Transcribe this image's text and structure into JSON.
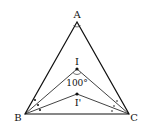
{
  "diagram": {
    "points": {
      "A": {
        "label": "A",
        "x": 77,
        "y": 22
      },
      "B": {
        "label": "B",
        "x": 25,
        "y": 114
      },
      "C": {
        "label": "C",
        "x": 129,
        "y": 114
      },
      "I": {
        "label": "I",
        "x": 77,
        "y": 69
      },
      "I2": {
        "label": "I'",
        "x": 77,
        "y": 94
      }
    },
    "angle_label": "100°",
    "colors": {
      "stroke": "#111111",
      "background": "#ffffff"
    }
  }
}
